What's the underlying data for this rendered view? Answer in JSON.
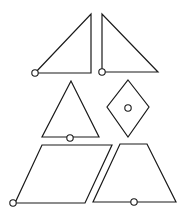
{
  "diagram": {
    "background": "#ffffff",
    "stroke_color": "#1a1a1a",
    "marker_radius": 3.2,
    "shapes": [
      {
        "name": "right-triangle-left",
        "type": "right-triangle",
        "points": [
          [
            35,
            73
          ],
          [
            91,
            14
          ],
          [
            91,
            73
          ]
        ],
        "marker": [
          35,
          73
        ]
      },
      {
        "name": "right-triangle-right",
        "type": "right-triangle",
        "points": [
          [
            102,
            14
          ],
          [
            102,
            72
          ],
          [
            158,
            72
          ]
        ],
        "marker": [
          102,
          72
        ]
      },
      {
        "name": "isosceles-triangle",
        "type": "triangle",
        "points": [
          [
            71,
            81
          ],
          [
            42,
            137
          ],
          [
            99,
            137
          ]
        ],
        "marker": [
          70,
          138
        ]
      },
      {
        "name": "rhombus",
        "type": "rhombus",
        "points": [
          [
            128,
            80
          ],
          [
            149,
            107
          ],
          [
            128,
            137
          ],
          [
            107,
            107
          ]
        ],
        "marker": [
          128,
          108
        ]
      },
      {
        "name": "parallelogram",
        "type": "parallelogram",
        "points": [
          [
            42,
            145
          ],
          [
            112,
            145
          ],
          [
            85,
            203
          ],
          [
            15,
            203
          ]
        ],
        "marker": [
          13,
          203
        ]
      },
      {
        "name": "trapezoid",
        "type": "trapezoid",
        "points": [
          [
            120,
            144
          ],
          [
            147,
            144
          ],
          [
            176,
            202
          ],
          [
            93,
            202
          ]
        ],
        "marker": [
          134,
          202
        ]
      }
    ]
  }
}
